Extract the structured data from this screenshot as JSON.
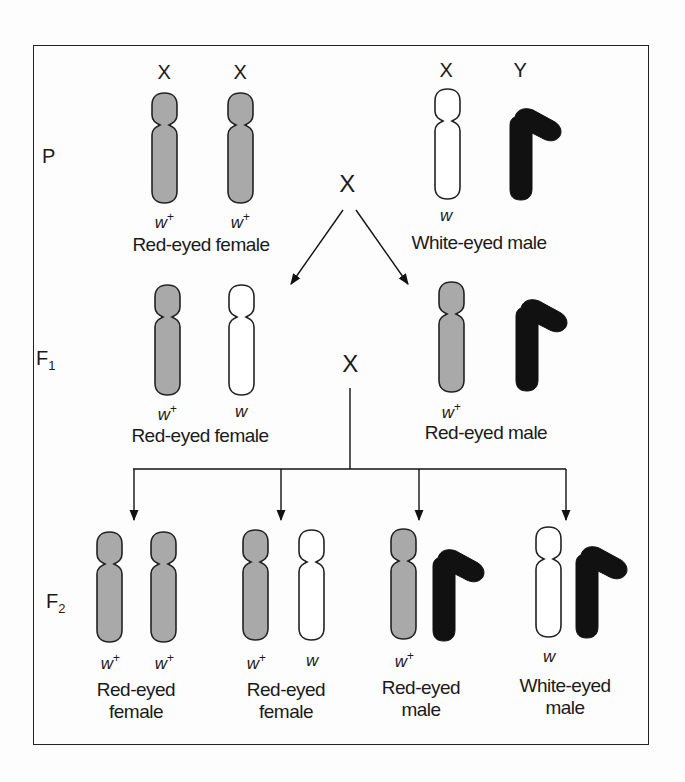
{
  "figure": {
    "title": "",
    "colors": {
      "x_wildtype_fill": "#a9a9a9",
      "x_mutant_fill": "#ffffff",
      "y_fill": "#111111",
      "outline": "#222222"
    }
  },
  "generations": {
    "P": {
      "label": "P",
      "female": {
        "chromosome_labels": [
          "X",
          "X"
        ],
        "alleles": [
          "w+",
          "w+"
        ],
        "phenotype": "Red-eyed female"
      },
      "male": {
        "chromosome_labels": [
          "X",
          "Y"
        ],
        "alleles": [
          "w"
        ],
        "phenotype": "White-eyed male"
      },
      "cross_symbol": "X"
    },
    "F1": {
      "label": "F",
      "subscript": "1",
      "female": {
        "alleles": [
          "w+",
          "w"
        ],
        "phenotype": "Red-eyed female"
      },
      "male": {
        "alleles": [
          "w+"
        ],
        "phenotype": "Red-eyed male"
      },
      "cross_symbol": "X"
    },
    "F2": {
      "label": "F",
      "subscript": "2",
      "offspring": [
        {
          "alleles": [
            "w+",
            "w+"
          ],
          "phenotype_line1": "Red-eyed",
          "phenotype_line2": "female"
        },
        {
          "alleles": [
            "w+",
            "w"
          ],
          "phenotype_line1": "Red-eyed",
          "phenotype_line2": "female"
        },
        {
          "alleles": [
            "w+"
          ],
          "phenotype_line1": "Red-eyed",
          "phenotype_line2": "male"
        },
        {
          "alleles": [
            "w"
          ],
          "phenotype_line1": "White-eyed",
          "phenotype_line2": "male"
        }
      ]
    }
  }
}
